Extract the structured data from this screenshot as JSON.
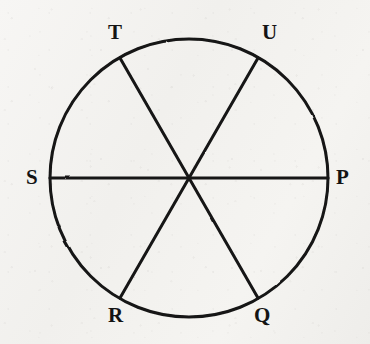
{
  "figure": {
    "kind": "geometry-figure",
    "background_color": "#f4f3f1",
    "ink_color": "#141414"
  },
  "circle": {
    "center_x": 189,
    "center_y": 178,
    "radius": 139,
    "stroke_width": 3,
    "stroke_color": "#141414"
  },
  "diameters": [
    {
      "id": "diameter-sp",
      "from": "S",
      "to": "P",
      "x1": 50,
      "y1": 178,
      "x2": 328,
      "y2": 178,
      "stroke_width": 3
    },
    {
      "id": "diameter-tq",
      "from": "T",
      "to": "Q",
      "x1": 120,
      "y1": 58,
      "x2": 258,
      "y2": 298,
      "stroke_width": 3
    },
    {
      "id": "diameter-ur",
      "from": "U",
      "to": "R",
      "x1": 258,
      "y1": 58,
      "x2": 120,
      "y2": 298,
      "stroke_width": 3
    }
  ],
  "points": [
    {
      "id": "point-p",
      "label": "P",
      "angle_deg": 0,
      "x": 328,
      "y": 178,
      "label_x": 336,
      "label_y": 167
    },
    {
      "id": "point-u",
      "label": "U",
      "angle_deg": 60,
      "x": 258,
      "y": 58,
      "label_x": 262,
      "label_y": 22
    },
    {
      "id": "point-t",
      "label": "T",
      "angle_deg": 120,
      "x": 120,
      "y": 58,
      "label_x": 108,
      "label_y": 22
    },
    {
      "id": "point-s",
      "label": "S",
      "angle_deg": 180,
      "x": 50,
      "y": 178,
      "label_x": 26,
      "label_y": 167
    },
    {
      "id": "point-r",
      "label": "R",
      "angle_deg": 240,
      "x": 120,
      "y": 298,
      "label_x": 108,
      "label_y": 305
    },
    {
      "id": "point-q",
      "label": "Q",
      "angle_deg": 300,
      "x": 258,
      "y": 298,
      "label_x": 254,
      "label_y": 305
    }
  ]
}
